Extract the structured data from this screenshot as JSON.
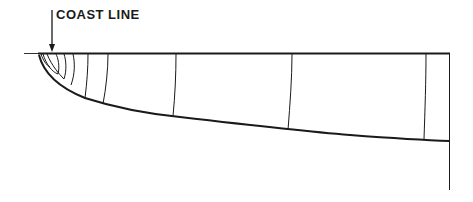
{
  "diagram": {
    "label": "COAST LINE",
    "stroke_color": "#1a1a1a",
    "background": "#ffffff"
  }
}
